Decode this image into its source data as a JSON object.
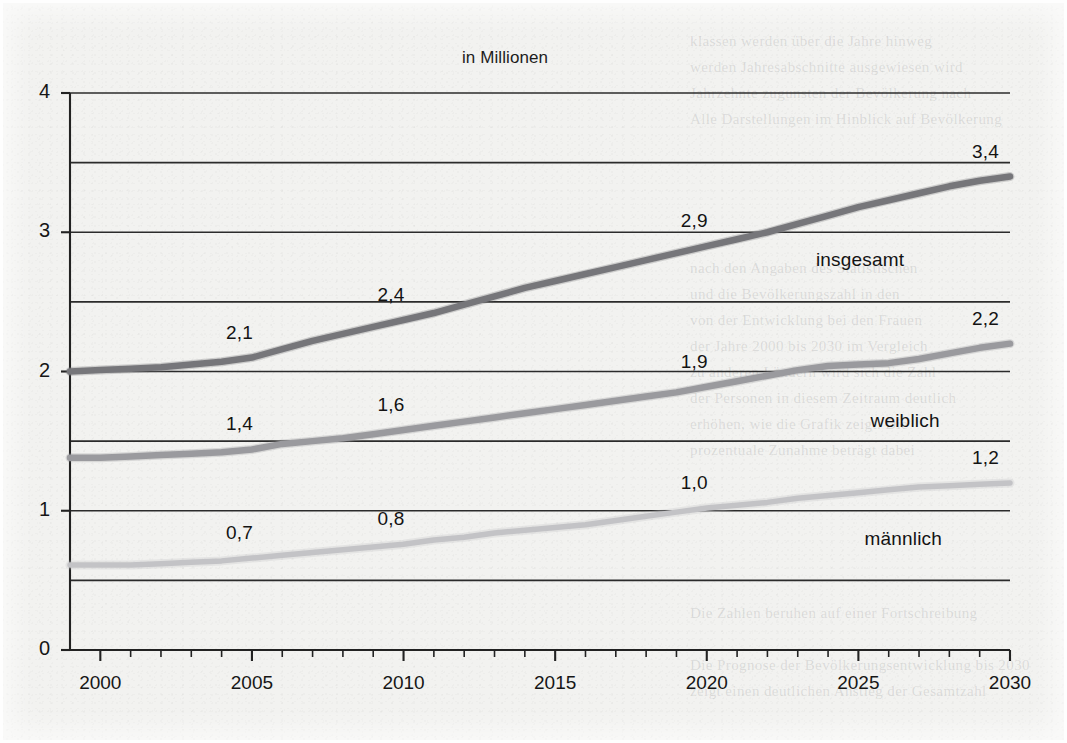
{
  "chart_data": {
    "type": "line",
    "title": "in Millionen",
    "xlabel": "",
    "ylabel": "",
    "xlim": [
      1999,
      2030
    ],
    "ylim": [
      0,
      4
    ],
    "ytick_step": 1,
    "gridline_step": 0.5,
    "grid": true,
    "legend_position": "inline-right",
    "x": [
      1999,
      2000,
      2001,
      2002,
      2003,
      2004,
      2005,
      2006,
      2007,
      2008,
      2009,
      2010,
      2011,
      2012,
      2013,
      2014,
      2015,
      2016,
      2017,
      2018,
      2019,
      2020,
      2021,
      2022,
      2023,
      2024,
      2025,
      2026,
      2027,
      2028,
      2029,
      2030
    ],
    "xticks": [
      2000,
      2005,
      2010,
      2015,
      2020,
      2025,
      2030
    ],
    "xtick_labels": [
      "2000",
      "2005",
      "2010",
      "2015",
      "2020",
      "2025",
      "2030"
    ],
    "yticks": [
      0,
      1,
      2,
      3,
      4
    ],
    "ytick_labels": [
      "0",
      "1",
      "2",
      "3",
      "4"
    ],
    "series": [
      {
        "name": "insgesamt",
        "color": "#76767a",
        "values": [
          2.0,
          2.01,
          2.02,
          2.03,
          2.05,
          2.07,
          2.1,
          2.16,
          2.22,
          2.27,
          2.32,
          2.37,
          2.42,
          2.48,
          2.54,
          2.6,
          2.65,
          2.7,
          2.75,
          2.8,
          2.85,
          2.9,
          2.95,
          3.0,
          3.06,
          3.12,
          3.18,
          3.23,
          3.28,
          3.33,
          3.37,
          3.4
        ]
      },
      {
        "name": "weiblich",
        "color": "#9a9a9e",
        "values": [
          1.38,
          1.38,
          1.39,
          1.4,
          1.41,
          1.42,
          1.44,
          1.48,
          1.5,
          1.52,
          1.55,
          1.58,
          1.61,
          1.64,
          1.67,
          1.7,
          1.73,
          1.76,
          1.79,
          1.82,
          1.85,
          1.89,
          1.93,
          1.97,
          2.01,
          2.04,
          2.05,
          2.06,
          2.09,
          2.13,
          2.17,
          2.2
        ]
      },
      {
        "name": "männlich",
        "color": "#c3c3c6",
        "values": [
          0.61,
          0.61,
          0.61,
          0.62,
          0.63,
          0.64,
          0.66,
          0.68,
          0.7,
          0.72,
          0.74,
          0.76,
          0.79,
          0.81,
          0.84,
          0.86,
          0.88,
          0.9,
          0.93,
          0.96,
          0.99,
          1.02,
          1.04,
          1.06,
          1.09,
          1.11,
          1.13,
          1.15,
          1.17,
          1.18,
          1.19,
          1.2
        ]
      }
    ],
    "annotations": [
      {
        "series": "insgesamt",
        "x": 2005,
        "y": 2.1,
        "text": "2,1"
      },
      {
        "series": "insgesamt",
        "x": 2010,
        "y": 2.37,
        "text": "2,4"
      },
      {
        "series": "insgesamt",
        "x": 2020,
        "y": 2.9,
        "text": "2,9"
      },
      {
        "series": "insgesamt",
        "x": 2030,
        "y": 3.4,
        "text": "3,4"
      },
      {
        "series": "weiblich",
        "x": 2005,
        "y": 1.44,
        "text": "1,4"
      },
      {
        "series": "weiblich",
        "x": 2010,
        "y": 1.58,
        "text": "1,6"
      },
      {
        "series": "weiblich",
        "x": 2020,
        "y": 1.89,
        "text": "1,9"
      },
      {
        "series": "weiblich",
        "x": 2030,
        "y": 2.2,
        "text": "2,2"
      },
      {
        "series": "männlich",
        "x": 2005,
        "y": 0.66,
        "text": "0,7"
      },
      {
        "series": "männlich",
        "x": 2010,
        "y": 0.76,
        "text": "0,8"
      },
      {
        "series": "männlich",
        "x": 2020,
        "y": 1.02,
        "text": "1,0"
      },
      {
        "series": "männlich",
        "x": 2030,
        "y": 1.2,
        "text": "1,2"
      }
    ],
    "series_labels": [
      {
        "text": "insgesamt",
        "x": 2023.6,
        "y": 2.92
      },
      {
        "text": "weiblich",
        "x": 2025.4,
        "y": 1.77
      },
      {
        "text": "männlich",
        "x": 2025.2,
        "y": 0.92
      }
    ],
    "colors": {
      "axis": "#222222",
      "gridline": "#2b2b2b",
      "text": "#131313",
      "paper": "#f2f2f0"
    }
  },
  "bleed_text": {
    "top_right": "klassen werden über die Jahre hinweg\nwerden Jahresabschnitte ausgewiesen wird\nJahrzehnte zugunsten der Bevölkerung nach\nAlle Darstellungen im Hinblick auf Bevölkerung",
    "mid_right": "nach den Angaben des Statistischen\nund die Bevölkerungszahl in den\nvon der Entwicklung bei den Frauen\nder Jahre 2000 bis 2030 im Vergleich\nzu anderen Ländern wird sich die Zahl\nder Personen in diesem Zeitraum deutlich\nerhöhen, wie die Grafik zeigt. Die\nprozentuale Zunahme beträgt dabei",
    "bottom_right": "Die Zahlen beruhen auf einer Fortschreibung\n\nDie Prognose der Bevölkerungsentwicklung bis 2030\nzeigt einen deutlichen Anstieg der Gesamtzahl"
  }
}
